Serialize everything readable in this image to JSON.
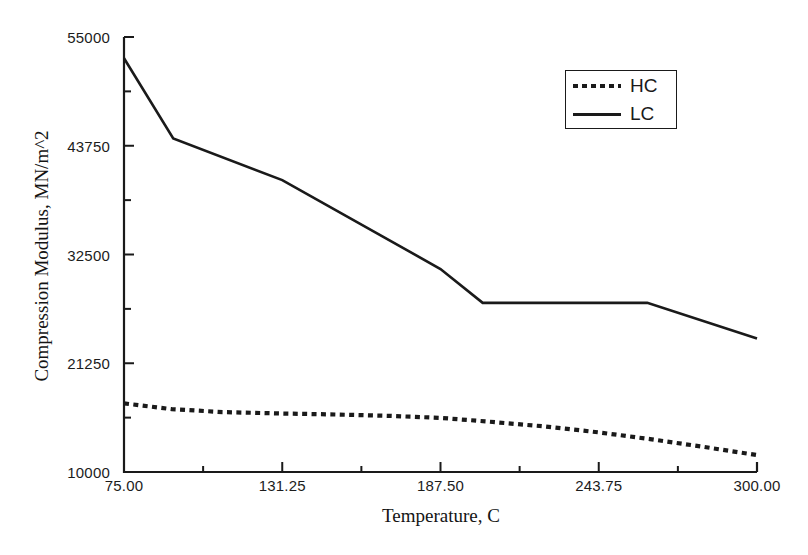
{
  "chart_data": {
    "type": "line",
    "title": "",
    "xlabel": "Temperature, C",
    "ylabel": "Compression Modulus, MN/m^2",
    "xlim": [
      75,
      300
    ],
    "ylim": [
      10000,
      55000
    ],
    "grid": false,
    "legend_position": "top-right",
    "xticks": [
      "75.00",
      "131.25",
      "187.50",
      "243.75",
      "300.00"
    ],
    "xtick_values": [
      75,
      131.25,
      187.5,
      243.75,
      300
    ],
    "yticks": [
      "55000",
      "43750",
      "32500",
      "21250",
      "10000"
    ],
    "ytick_values": [
      55000,
      43750,
      32500,
      21250,
      10000
    ],
    "series": [
      {
        "name": "HC",
        "style": "dotted",
        "color": "#1a1a1a",
        "x": [
          75,
          92,
          110,
          131.25,
          150,
          170,
          187.5,
          205,
          225,
          243.75,
          262,
          281,
          300
        ],
        "values": [
          17100,
          16500,
          16200,
          16050,
          15950,
          15800,
          15600,
          15200,
          14700,
          14100,
          13400,
          12600,
          11750
        ]
      },
      {
        "name": "LC",
        "style": "solid",
        "color": "#1a1a1a",
        "x": [
          75,
          92.5,
          131.25,
          187.5,
          202.5,
          243.75,
          261,
          300
        ],
        "values": [
          52800,
          44500,
          40200,
          31000,
          27500,
          27500,
          27500,
          23800
        ]
      }
    ]
  },
  "legend": {
    "entries": [
      {
        "label": "HC",
        "style": "dotted"
      },
      {
        "label": "LC",
        "style": "solid"
      }
    ]
  },
  "axes": {
    "x_title": "Temperature, C",
    "y_title": "Compression Modulus, MN/m^2"
  }
}
